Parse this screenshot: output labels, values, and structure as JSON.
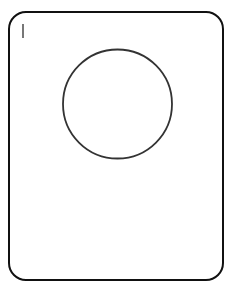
{
  "card": {
    "text_value": "",
    "border_color": "#111111"
  },
  "shape": {
    "type": "circle",
    "stroke_color": "#333333",
    "fill_color": "#ffffff"
  }
}
